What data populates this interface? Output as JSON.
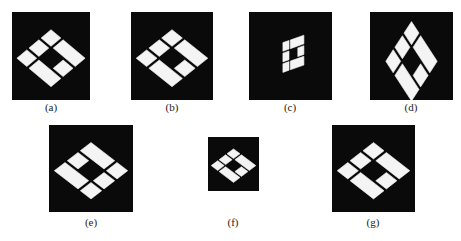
{
  "figure": {
    "panels": [
      {
        "id": "a",
        "label": "(a)",
        "pattern": "base",
        "transform": "identity"
      },
      {
        "id": "b",
        "label": "(b)",
        "pattern": "base",
        "transform": "identity"
      },
      {
        "id": "c",
        "label": "(c)",
        "pattern": "base",
        "transform": "shear-compressed"
      },
      {
        "id": "d",
        "label": "(d)",
        "pattern": "base",
        "transform": "rotated-vertical"
      },
      {
        "id": "e",
        "label": "(e)",
        "pattern": "variant",
        "transform": "identity"
      },
      {
        "id": "f",
        "label": "(f)",
        "pattern": "base",
        "transform": "scaled-down"
      },
      {
        "id": "g",
        "label": "(g)",
        "pattern": "base",
        "transform": "identity"
      }
    ],
    "colors": {
      "background": "#0a0a0a",
      "foreground": "#f4f4f4",
      "page": "#ffffff"
    }
  }
}
